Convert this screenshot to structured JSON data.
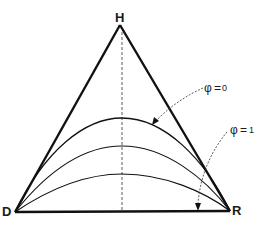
{
  "diagram": {
    "type": "ternary-triangle",
    "vertices": {
      "top": {
        "label": "H"
      },
      "bottom_left": {
        "label": "D"
      },
      "bottom_right": {
        "label": "R"
      }
    },
    "curves": [
      {
        "name": "curve-upper",
        "annotation": "φ = 0"
      },
      {
        "name": "curve-middle"
      },
      {
        "name": "curve-lower"
      }
    ],
    "annotations": [
      {
        "symbol": "φ",
        "equals": "=",
        "value": "0",
        "target": "upper curve"
      },
      {
        "symbol": "φ",
        "equals": "=",
        "value": "1",
        "target": "base line D–R"
      }
    ],
    "axis": {
      "style": "dashed vertical line from H to base"
    }
  },
  "colors": {
    "line": "#1a1a1a",
    "background": "#ffffff"
  }
}
